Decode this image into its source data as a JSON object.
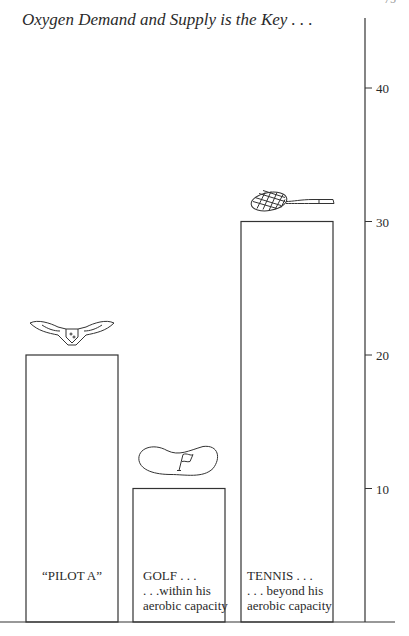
{
  "page": {
    "number": "75"
  },
  "chart_data": {
    "type": "bar",
    "title": "Oxygen Demand and Supply is the Key . . .",
    "xlabel": "",
    "ylabel": "",
    "ylim": [
      0,
      45
    ],
    "yticks": [
      10,
      20,
      30,
      40
    ],
    "grid": false,
    "axis_position": "right",
    "categories": [
      "“PILOT A”",
      "GOLF . . .",
      "TENNIS . . ."
    ],
    "category_sublabels": [
      [],
      [
        ". . .within his",
        "aerobic capacity"
      ],
      [
        ". . . beyond his",
        "aerobic capacity"
      ]
    ],
    "values": [
      20,
      10,
      30
    ],
    "bar_icons": [
      "pilot-wings-icon",
      "golf-green-flag-icon",
      "tennis-racket-icon"
    ]
  }
}
